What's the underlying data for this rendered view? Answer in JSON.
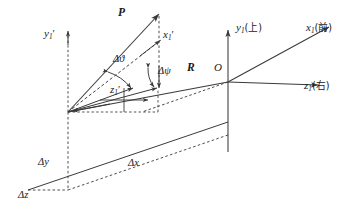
{
  "figure": {
    "kind": "3d-coordinate-vector-diagram",
    "background_color": "#ffffff",
    "line_color": "#3a3a3a",
    "text_color": "#1a1a1a"
  },
  "labels": {
    "point_p": "P",
    "vector_r": "R",
    "origin_o": "O",
    "axis_x1": "x",
    "axis_x1_sub": "1",
    "axis_x1_paren": "(前)",
    "axis_y1": "y",
    "axis_y1_sub": "1",
    "axis_y1_paren": "(上)",
    "axis_z1": "z",
    "axis_z1_sub": "1",
    "axis_z1_paren": "(右)",
    "axis_x1_prime": "x",
    "axis_x1_prime_sub": "1",
    "axis_x1_prime_mark": "′",
    "axis_y1_prime": "y",
    "axis_y1_prime_sub": "1",
    "axis_y1_prime_mark": "′",
    "axis_z1_prime": "z",
    "axis_z1_prime_sub": "1",
    "axis_z1_prime_mark": "′",
    "angle_theta": "Δϑ",
    "angle_psi": "Δψ",
    "delta_x": "Δx",
    "delta_y": "Δy",
    "delta_z": "Δz"
  },
  "geometry": {
    "frame_prime_origin": [
      68,
      112
    ],
    "frame_origin_o": [
      228,
      82
    ],
    "point_p_tip": [
      160,
      12
    ],
    "axis_x1_tip": [
      333,
      25
    ],
    "axis_y1_tip": [
      228,
      26
    ],
    "axis_z1_tip": [
      322,
      86
    ],
    "delta_y_bottom": [
      68,
      190
    ],
    "delta_z_left": [
      28,
      190
    ],
    "delta_x_span": "from 28,190 to 228,82"
  }
}
